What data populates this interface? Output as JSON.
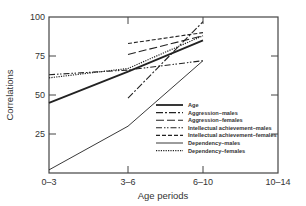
{
  "chart_data": {
    "type": "line",
    "title": "",
    "xlabel": "Age periods",
    "ylabel": "Correlations",
    "categories": [
      "0–3",
      "3–6",
      "6–10",
      "10–14"
    ],
    "ylim": [
      0,
      100
    ],
    "yticks": [
      0,
      25,
      50,
      75,
      100
    ],
    "ytick_labels": [
      "",
      "25",
      "50",
      "75",
      "100"
    ],
    "grid": false,
    "legend_position": "bottom-right",
    "series": [
      {
        "name": "Age",
        "style": "thick-solid",
        "values": [
          45,
          65,
          85,
          null
        ]
      },
      {
        "name": "Aggression–males",
        "style": "dash-dot",
        "values": [
          null,
          48,
          97,
          null
        ]
      },
      {
        "name": "Aggression–females",
        "style": "long-dash",
        "values": [
          null,
          76,
          88,
          null
        ]
      },
      {
        "name": "Intellectual achievement–males",
        "style": "dash-dot-dot",
        "values": [
          63,
          66,
          72,
          null
        ]
      },
      {
        "name": "Intellectual achievement–females",
        "style": "short-dash",
        "values": [
          null,
          83,
          90,
          null
        ]
      },
      {
        "name": "Dependency–males",
        "style": "thin-solid",
        "values": [
          2,
          30,
          72,
          null
        ]
      },
      {
        "name": "Dependency–females",
        "style": "dotted",
        "values": [
          61,
          67,
          88,
          null
        ]
      }
    ]
  }
}
